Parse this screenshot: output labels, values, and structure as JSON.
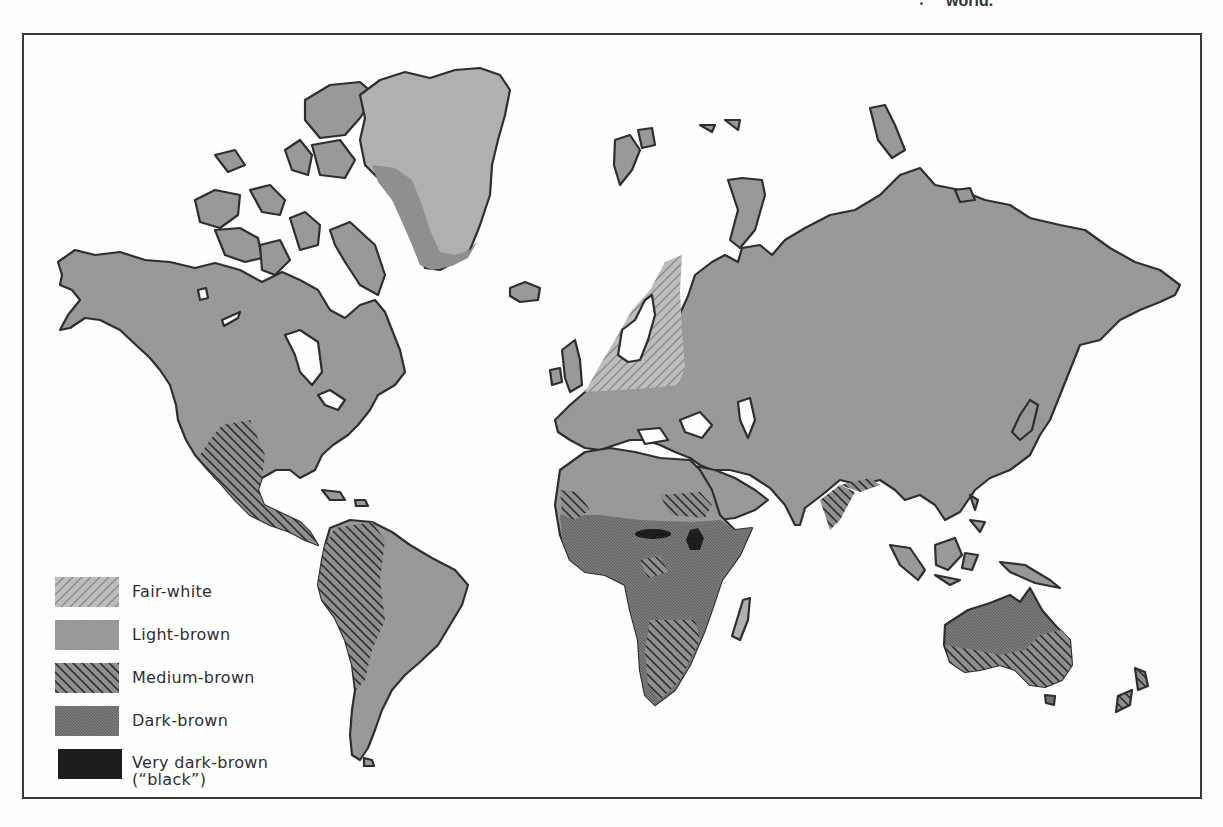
{
  "caption_fragment": "world.",
  "map": {
    "title": "Skin color distribution across the world",
    "colors": {
      "ocean": "#fefefe",
      "fair_white": "#b8b8b8",
      "light_brown": "#9a9a9a",
      "medium_brown": "#8c8c8c",
      "dark_brown": "#7a7a7a",
      "very_dark_brown": "#1e1e1e",
      "coast_outline": "#2e2e2e",
      "frame": "#3a3a3a"
    },
    "regions": [
      {
        "name": "Northern Europe / Scandinavia",
        "category": "Fair-white"
      },
      {
        "name": "Greenland interior",
        "category": "Fair-white"
      },
      {
        "name": "North America",
        "category": "Light-brown"
      },
      {
        "name": "Eurasia",
        "category": "Light-brown"
      },
      {
        "name": "North Africa",
        "category": "Light-brown"
      },
      {
        "name": "Southwestern USA & Mexico",
        "category": "Medium-brown"
      },
      {
        "name": "Western South America",
        "category": "Medium-brown"
      },
      {
        "name": "Sahel band",
        "category": "Medium-brown"
      },
      {
        "name": "Southern Africa",
        "category": "Medium-brown"
      },
      {
        "name": "Southern India",
        "category": "Medium-brown"
      },
      {
        "name": "Southern Australia",
        "category": "Medium-brown"
      },
      {
        "name": "Central Africa",
        "category": "Dark-brown"
      },
      {
        "name": "Australia interior",
        "category": "Dark-brown"
      },
      {
        "name": "Central Sudan / Chad",
        "category": "Very dark-brown"
      },
      {
        "name": "Southern Sudan / Ethiopia border",
        "category": "Very dark-brown"
      }
    ]
  },
  "legend": {
    "items": [
      {
        "label": "Fair-white",
        "pattern": "fair-white"
      },
      {
        "label": "Light-brown",
        "pattern": "light-brown"
      },
      {
        "label": "Medium-brown",
        "pattern": "medium-brown"
      },
      {
        "label": "Dark-brown",
        "pattern": "dark-brown"
      },
      {
        "label_line1": "Very dark-brown",
        "label_line2": "(“black”)",
        "pattern": "very-dark-brown"
      }
    ]
  }
}
